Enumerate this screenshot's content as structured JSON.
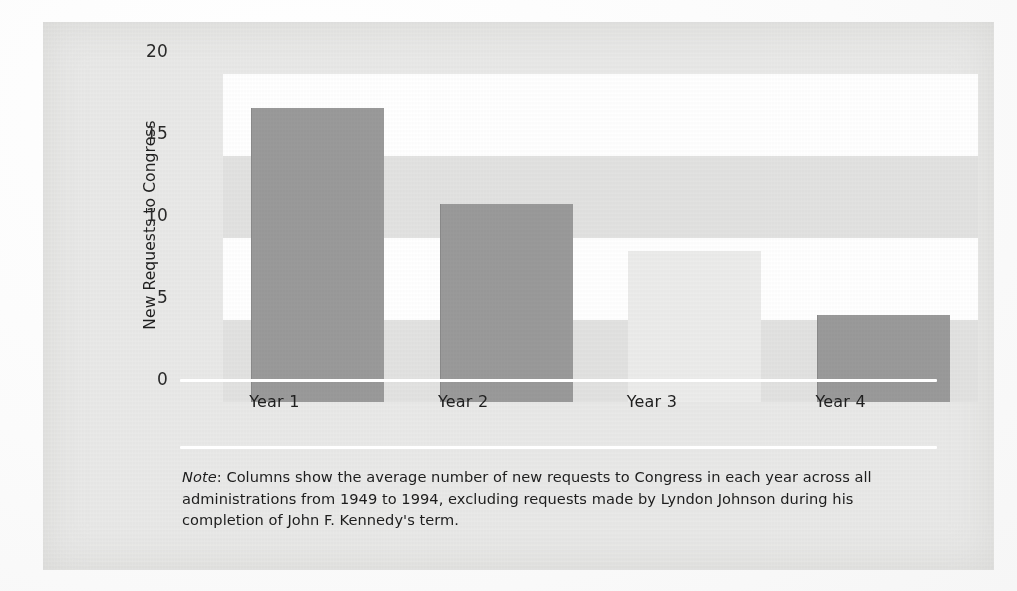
{
  "figure": {
    "note_lead": "Note",
    "note_text": ": Columns show the average number of new requests to Congress in each year across all administrations from 1949 to 1994, excluding requests made by Lyndon Johnson during his completion of John F. Kennedy's term."
  },
  "colors": {
    "panel_background": "#e9e9e8",
    "band_white": "#ffffff",
    "band_grey": "#e2e2e1",
    "bar_dark": "#9a9a9a",
    "bar_faint": "#ececeb",
    "axis_line": "#ffffff",
    "text": "#1f1f1f"
  },
  "chart_data": {
    "type": "bar",
    "title": "",
    "xlabel": "",
    "ylabel": "New Requests to Congress",
    "categories": [
      "Year 1",
      "Year 2",
      "Year 3",
      "Year 4"
    ],
    "values": [
      17.9,
      12.1,
      9.2,
      5.3
    ],
    "ylim": [
      0,
      20
    ],
    "yticks": [
      0,
      5,
      10,
      15,
      20
    ],
    "ytick_labels": [
      "0",
      "5",
      "10",
      "15",
      "20"
    ],
    "grid": "alternating horizontal bands",
    "legend": "none",
    "bands": [
      {
        "from": 15,
        "to": 20,
        "fill": "white"
      },
      {
        "from": 10,
        "to": 15,
        "fill": "grey"
      },
      {
        "from": 5,
        "to": 10,
        "fill": "white"
      },
      {
        "from": 0,
        "to": 5,
        "fill": "grey"
      }
    ],
    "bar_styles": [
      "dark",
      "dark",
      "faint",
      "dark"
    ],
    "annotations": []
  }
}
